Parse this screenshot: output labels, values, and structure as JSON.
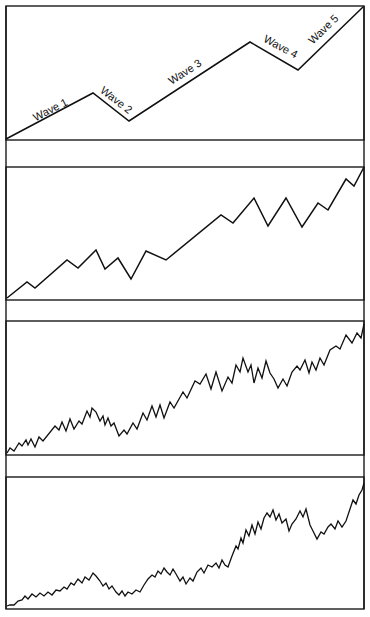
{
  "chart_data": [
    {
      "type": "line",
      "title": "",
      "panel": 1,
      "description": "Idealized five-wave impulse pattern",
      "xlabel": "",
      "ylabel": "",
      "grid": false,
      "labels": [
        "Wave 1",
        "Wave 2",
        "Wave 3",
        "Wave 4",
        "Wave 5"
      ],
      "points": [
        [
          6,
          139
        ],
        [
          93,
          93
        ],
        [
          129,
          121
        ],
        [
          250,
          42
        ],
        [
          298,
          70
        ],
        [
          363,
          7
        ]
      ]
    },
    {
      "type": "line",
      "panel": 2,
      "description": "Five-wave pattern subdivided (lower degree waves)",
      "grid": false,
      "points": [
        [
          7,
          298
        ],
        [
          27,
          282
        ],
        [
          35,
          288
        ],
        [
          67,
          260
        ],
        [
          78,
          268
        ],
        [
          96,
          250
        ],
        [
          105,
          269
        ],
        [
          118,
          258
        ],
        [
          131,
          279
        ],
        [
          146,
          251
        ],
        [
          166,
          260
        ],
        [
          221,
          215
        ],
        [
          233,
          223
        ],
        [
          254,
          198
        ],
        [
          268,
          226
        ],
        [
          286,
          198
        ],
        [
          302,
          227
        ],
        [
          318,
          203
        ],
        [
          328,
          210
        ],
        [
          346,
          179
        ],
        [
          354,
          186
        ],
        [
          364,
          167
        ]
      ]
    },
    {
      "type": "line",
      "panel": 3,
      "description": "Five-wave pattern subdivided two degrees",
      "grid": false,
      "points": [
        [
          7,
          453
        ],
        [
          10,
          448
        ],
        [
          14,
          451
        ],
        [
          19,
          443
        ],
        [
          22,
          446
        ],
        [
          26,
          440
        ],
        [
          28,
          445
        ],
        [
          31,
          439
        ],
        [
          35,
          447
        ],
        [
          39,
          437
        ],
        [
          43,
          441
        ],
        [
          55,
          426
        ],
        [
          59,
          430
        ],
        [
          62,
          422
        ],
        [
          66,
          431
        ],
        [
          70,
          419
        ],
        [
          74,
          429
        ],
        [
          79,
          421
        ],
        [
          82,
          424
        ],
        [
          87,
          411
        ],
        [
          90,
          417
        ],
        [
          92,
          408
        ],
        [
          96,
          412
        ],
        [
          100,
          421
        ],
        [
          103,
          416
        ],
        [
          105,
          425
        ],
        [
          108,
          418
        ],
        [
          111,
          426
        ],
        [
          114,
          423
        ],
        [
          119,
          436
        ],
        [
          124,
          430
        ],
        [
          127,
          434
        ],
        [
          133,
          423
        ],
        [
          137,
          429
        ],
        [
          143,
          413
        ],
        [
          147,
          420
        ],
        [
          152,
          406
        ],
        [
          156,
          417
        ],
        [
          160,
          405
        ],
        [
          164,
          418
        ],
        [
          170,
          402
        ],
        [
          174,
          408
        ],
        [
          183,
          392
        ],
        [
          187,
          398
        ],
        [
          195,
          381
        ],
        [
          200,
          384
        ],
        [
          206,
          374
        ],
        [
          211,
          389
        ],
        [
          216,
          372
        ],
        [
          222,
          391
        ],
        [
          228,
          377
        ],
        [
          232,
          383
        ],
        [
          236,
          365
        ],
        [
          240,
          372
        ],
        [
          243,
          358
        ],
        [
          248,
          372
        ],
        [
          251,
          365
        ],
        [
          254,
          383
        ],
        [
          258,
          368
        ],
        [
          262,
          378
        ],
        [
          266,
          361
        ],
        [
          270,
          373
        ],
        [
          274,
          379
        ],
        [
          278,
          388
        ],
        [
          283,
          379
        ],
        [
          287,
          386
        ],
        [
          292,
          372
        ],
        [
          297,
          366
        ],
        [
          300,
          370
        ],
        [
          305,
          360
        ],
        [
          309,
          373
        ],
        [
          312,
          362
        ],
        [
          316,
          370
        ],
        [
          320,
          358
        ],
        [
          324,
          365
        ],
        [
          330,
          350
        ],
        [
          336,
          346
        ],
        [
          340,
          349
        ],
        [
          346,
          335
        ],
        [
          352,
          343
        ],
        [
          357,
          333
        ],
        [
          361,
          338
        ],
        [
          364,
          324
        ]
      ]
    },
    {
      "type": "line",
      "panel": 4,
      "description": "Five-wave pattern subdivided three degrees",
      "grid": false,
      "points": [
        [
          7,
          606
        ],
        [
          10,
          605
        ],
        [
          14,
          605
        ],
        [
          18,
          601
        ],
        [
          22,
          600
        ],
        [
          25,
          596
        ],
        [
          28,
          599
        ],
        [
          32,
          594
        ],
        [
          36,
          597
        ],
        [
          40,
          593
        ],
        [
          44,
          596
        ],
        [
          48,
          592
        ],
        [
          52,
          595
        ],
        [
          56,
          590
        ],
        [
          60,
          591
        ],
        [
          64,
          587
        ],
        [
          67,
          589
        ],
        [
          71,
          583
        ],
        [
          74,
          585
        ],
        [
          78,
          579
        ],
        [
          82,
          583
        ],
        [
          85,
          577
        ],
        [
          89,
          580
        ],
        [
          93,
          573
        ],
        [
          96,
          576
        ],
        [
          100,
          581
        ],
        [
          103,
          586
        ],
        [
          106,
          583
        ],
        [
          109,
          589
        ],
        [
          112,
          586
        ],
        [
          116,
          592
        ],
        [
          119,
          595
        ],
        [
          122,
          591
        ],
        [
          125,
          596
        ],
        [
          128,
          592
        ],
        [
          132,
          594
        ],
        [
          136,
          590
        ],
        [
          140,
          592
        ],
        [
          144,
          585
        ],
        [
          148,
          579
        ],
        [
          152,
          575
        ],
        [
          155,
          577
        ],
        [
          158,
          571
        ],
        [
          161,
          574
        ],
        [
          164,
          568
        ],
        [
          167,
          572
        ],
        [
          170,
          575
        ],
        [
          173,
          569
        ],
        [
          176,
          574
        ],
        [
          180,
          581
        ],
        [
          183,
          577
        ],
        [
          186,
          584
        ],
        [
          190,
          578
        ],
        [
          193,
          581
        ],
        [
          197,
          572
        ],
        [
          201,
          568
        ],
        [
          204,
          573
        ],
        [
          208,
          565
        ],
        [
          212,
          567
        ],
        [
          216,
          563
        ],
        [
          219,
          568
        ],
        [
          222,
          560
        ],
        [
          225,
          565
        ],
        [
          228,
          567
        ],
        [
          232,
          556
        ],
        [
          236,
          546
        ],
        [
          238,
          549
        ],
        [
          241,
          538
        ],
        [
          243,
          543
        ],
        [
          246,
          530
        ],
        [
          249,
          536
        ],
        [
          252,
          525
        ],
        [
          255,
          534
        ],
        [
          258,
          522
        ],
        [
          261,
          529
        ],
        [
          264,
          518
        ],
        [
          267,
          513
        ],
        [
          270,
          517
        ],
        [
          273,
          510
        ],
        [
          276,
          520
        ],
        [
          279,
          514
        ],
        [
          282,
          523
        ],
        [
          286,
          519
        ],
        [
          289,
          531
        ],
        [
          292,
          524
        ],
        [
          296,
          519
        ],
        [
          300,
          511
        ],
        [
          303,
          517
        ],
        [
          306,
          509
        ],
        [
          310,
          525
        ],
        [
          313,
          531
        ],
        [
          317,
          539
        ],
        [
          321,
          532
        ],
        [
          324,
          534
        ],
        [
          328,
          527
        ],
        [
          331,
          524
        ],
        [
          335,
          529
        ],
        [
          338,
          521
        ],
        [
          342,
          527
        ],
        [
          346,
          521
        ],
        [
          350,
          509
        ],
        [
          353,
          500
        ],
        [
          356,
          504
        ],
        [
          359,
          495
        ],
        [
          362,
          490
        ],
        [
          364,
          483
        ]
      ]
    }
  ],
  "panels": [
    {
      "id": "panel-1",
      "wave_labels": [
        {
          "text": "Wave 1",
          "x": 52,
          "y": 113,
          "angle": -27
        },
        {
          "text": "Wave 2",
          "x": 114,
          "y": 103,
          "angle": 38
        },
        {
          "text": "Wave 3",
          "x": 187,
          "y": 75,
          "angle": -33
        },
        {
          "text": "Wave 4",
          "x": 279,
          "y": 50,
          "angle": 28
        },
        {
          "text": "Wave 5",
          "x": 326,
          "y": 32,
          "angle": -44
        }
      ]
    },
    {
      "id": "panel-2"
    },
    {
      "id": "panel-3"
    },
    {
      "id": "panel-4"
    }
  ],
  "colors": {
    "line": "#111111",
    "frame": "#1a1a1a",
    "background": "#ffffff"
  }
}
